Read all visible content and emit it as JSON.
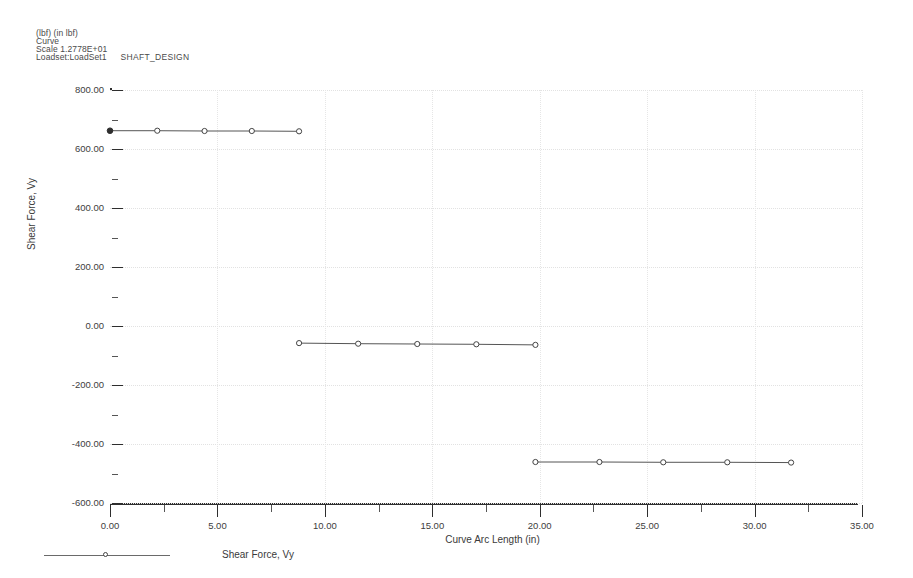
{
  "header": {
    "units": "(lbf)  (in lbf)",
    "curve": "Curve",
    "scale": "Scale  1.2778E+01",
    "loadset": "Loadset:LoadSet1",
    "loadset_name": "SHAFT_DESIGN"
  },
  "legend": {
    "label": "Shear Force, Vy",
    "marker_icon": "circle-marker-icon"
  },
  "chart_data": {
    "type": "line",
    "title": "",
    "subtitle": "",
    "xlabel": "Curve Arc Length (in)",
    "ylabel": "Shear Force, Vy",
    "xlim": [
      0,
      35
    ],
    "ylim": [
      -600,
      800
    ],
    "xticks": [
      0,
      5,
      10,
      15,
      20,
      25,
      30,
      35
    ],
    "xtick_labels": [
      "0.00",
      "5.00",
      "10.00",
      "15.00",
      "20.00",
      "25.00",
      "30.00",
      "35.00"
    ],
    "x_minor_step": 2.5,
    "yticks": [
      -600,
      -400,
      -200,
      0,
      200,
      400,
      600,
      800
    ],
    "ytick_labels": [
      "-600.00",
      "-400.00",
      "-200.00",
      "0.00",
      "200.00",
      "400.00",
      "600.00",
      "800.00"
    ],
    "y_minor_step": 100,
    "grid": true,
    "legend_position": "bottom-left",
    "series": [
      {
        "name": "Shear Force, Vy",
        "color": "#555555",
        "marker": "circle",
        "segments": [
          {
            "x": [
              0.0,
              2.2,
              4.4,
              6.6,
              8.8
            ],
            "y": [
              662,
              662,
              661,
              661,
              660
            ]
          },
          {
            "x": [
              8.8,
              11.55,
              14.3,
              17.05,
              19.8
            ],
            "y": [
              -58,
              -60,
              -61,
              -62,
              -64
            ]
          },
          {
            "x": [
              19.8,
              22.78,
              25.75,
              28.73,
              31.7
            ],
            "y": [
              -461,
              -461,
              -462,
              -462,
              -463
            ]
          }
        ]
      }
    ]
  }
}
